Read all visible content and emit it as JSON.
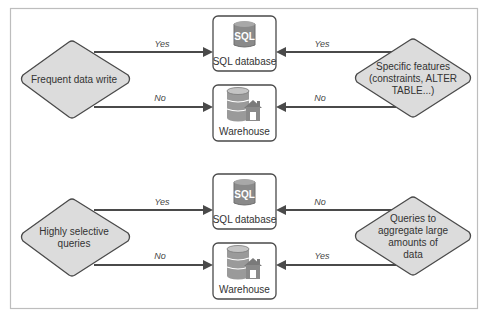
{
  "diagram": {
    "colors": {
      "diamond_fill": "#dcdcdc",
      "stroke": "#4a4a4a",
      "sql_icon": "#8a8a8a",
      "frame": "#bdbdbd"
    },
    "panels": [
      {
        "left_decision": {
          "lines": [
            "Frequent data write"
          ]
        },
        "right_decision": {
          "lines": [
            "Specific features",
            "(constraints, ALTER",
            "TABLE...)"
          ]
        },
        "sql_node": {
          "label": "SQL database",
          "icon": "sql-database-icon",
          "icon_text": "SQL"
        },
        "warehouse_node": {
          "label": "Warehouse",
          "icon": "warehouse-icon"
        },
        "edges": {
          "left_to_sql": "Yes",
          "left_to_warehouse": "No",
          "right_to_sql": "Yes",
          "right_to_warehouse": "No"
        }
      },
      {
        "left_decision": {
          "lines": [
            "Highly selective",
            "queries"
          ]
        },
        "right_decision": {
          "lines": [
            "Queries to",
            "aggregate large",
            "amounts of",
            "data"
          ]
        },
        "sql_node": {
          "label": "SQL database",
          "icon": "sql-database-icon",
          "icon_text": "SQL"
        },
        "warehouse_node": {
          "label": "Warehouse",
          "icon": "warehouse-icon"
        },
        "edges": {
          "left_to_sql": "Yes",
          "left_to_warehouse": "No",
          "right_to_sql": "No",
          "right_to_warehouse": "Yes"
        }
      }
    ]
  }
}
